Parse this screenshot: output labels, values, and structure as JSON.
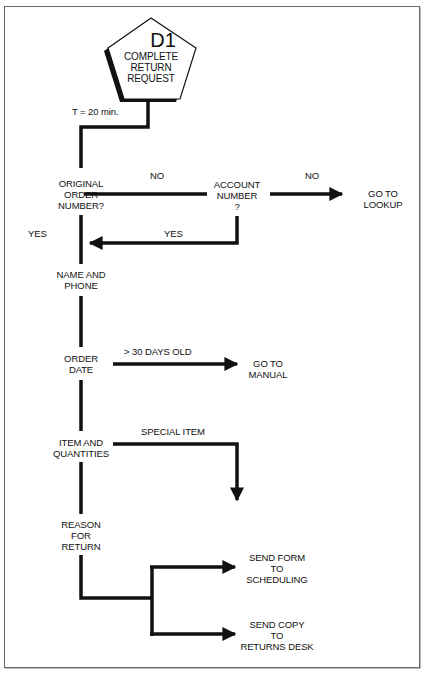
{
  "diagram": {
    "start": {
      "code": "D1",
      "lines": [
        "COMPLETE",
        "RETURN",
        "REQUEST"
      ]
    },
    "time_label": "T = 20 min.",
    "nodes": {
      "original_order": [
        "ORIGINAL",
        "ORDER",
        "NUMBER?"
      ],
      "account_number": [
        "ACCOUNT",
        "NUMBER",
        "?"
      ],
      "go_lookup": [
        "GO TO",
        "LOOKUP"
      ],
      "name_phone": [
        "NAME AND",
        "PHONE"
      ],
      "order_date": [
        "ORDER",
        "DATE"
      ],
      "go_manual": [
        "GO TO",
        "MANUAL"
      ],
      "item_quantities": [
        "ITEM AND",
        "QUANTITIES"
      ],
      "reason_return": [
        "REASON",
        "FOR",
        "RETURN"
      ],
      "send_scheduling": [
        "SEND FORM",
        "TO",
        "SCHEDULING"
      ],
      "send_returns": [
        "SEND COPY",
        "TO",
        "RETURNS DESK"
      ]
    },
    "edge_labels": {
      "no_1": "NO",
      "no_2": "NO",
      "yes_left": "YES",
      "yes_return": "YES",
      "over_30": "> 30 DAYS OLD",
      "special_item": "SPECIAL ITEM"
    },
    "colors": {
      "line": "#111111",
      "border": "#6a6a6a",
      "background": "#ffffff"
    }
  }
}
